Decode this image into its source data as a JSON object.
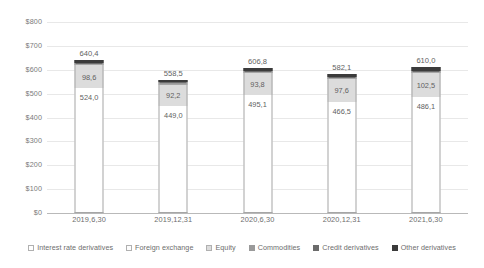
{
  "chart_data": {
    "type": "bar",
    "subtype": "stacked",
    "title": "",
    "xlabel": "",
    "ylabel": "",
    "ylim": [
      0,
      800
    ],
    "ytick_step": 100,
    "ytick_prefix": "$",
    "grid": true,
    "legend_position": "bottom",
    "decimal_separator": ",",
    "categories": [
      "2019,6,30",
      "2019,12,31",
      "2020,6,30",
      "2020,12,31",
      "2021,6,30"
    ],
    "ytick_labels": [
      "$800",
      "$700",
      "$600",
      "$500",
      "$400",
      "$300",
      "$200",
      "$100",
      "$0"
    ],
    "ytick_values": [
      800,
      700,
      600,
      500,
      400,
      300,
      200,
      100,
      0
    ],
    "series": [
      {
        "name": "Interest rate derivatives",
        "color": "#ffffff",
        "values": [
          524.0,
          449.0,
          495.1,
          466.5,
          486.1
        ],
        "labels": [
          "524,0",
          "449,0",
          "495,1",
          "466,5",
          "486,1"
        ]
      },
      {
        "name": "Foreign exchange",
        "color": "#fcfcfc",
        "values": [
          0,
          0,
          0,
          0,
          0
        ],
        "labels": [
          "",
          "",
          "",
          "",
          ""
        ]
      },
      {
        "name": "Equity",
        "color": "#dcdcdc",
        "values": [
          98.6,
          92.2,
          93.8,
          97.6,
          102.5
        ],
        "labels": [
          "98,6",
          "92,2",
          "93,8",
          "97,6",
          "102,5"
        ]
      },
      {
        "name": "Commodities",
        "color": "#9a9a9a",
        "values": [
          3.5,
          3.0,
          3.5,
          3.2,
          3.6
        ],
        "labels": [
          "",
          "",
          "",
          "",
          ""
        ]
      },
      {
        "name": "Credit derivatives",
        "color": "#6b6b6b",
        "values": [
          4.0,
          3.5,
          4.0,
          3.8,
          4.2
        ],
        "labels": [
          "",
          "",
          "",
          "",
          ""
        ]
      },
      {
        "name": "Other derivatives",
        "color": "#3b3b3b",
        "values": [
          10.3,
          10.8,
          10.4,
          11.0,
          13.6
        ],
        "labels": [
          "",
          "",
          "",
          "",
          ""
        ]
      }
    ],
    "totals": [
      640.4,
      558.5,
      606.8,
      582.1,
      610.0
    ],
    "total_labels": [
      "640,4",
      "558,5",
      "606,8",
      "582,1",
      "610,0"
    ]
  },
  "legend": {
    "items": [
      {
        "label": "Interest rate derivatives",
        "swatch": "#ffffff"
      },
      {
        "label": "Foreign exchange",
        "swatch": "#fcfcfc"
      },
      {
        "label": "Equity",
        "swatch": "#dcdcdc"
      },
      {
        "label": "Commodities",
        "swatch": "#9a9a9a"
      },
      {
        "label": "Credit derivatives",
        "swatch": "#6b6b6b"
      },
      {
        "label": "Other derivatives",
        "swatch": "#3b3b3b"
      }
    ]
  }
}
